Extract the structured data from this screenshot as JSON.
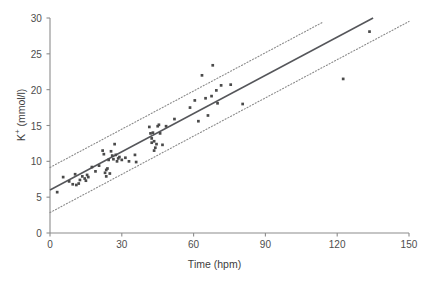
{
  "chart_data": {
    "type": "scatter",
    "title": "",
    "xlabel": "Time (hpm)",
    "ylabel_prefix": "K",
    "ylabel_sup": "+",
    "ylabel_suffix": " (mmol/l)",
    "ylabel": "K+ (mmol/l)",
    "xlim": [
      0,
      150
    ],
    "ylim": [
      0,
      30
    ],
    "xticks": [
      0,
      30,
      60,
      90,
      120,
      150
    ],
    "yticks": [
      0,
      5,
      10,
      15,
      20,
      25,
      30
    ],
    "xtick_labels": [
      "0",
      "30",
      "60",
      "90",
      "120",
      "150"
    ],
    "ytick_labels": [
      "0",
      "5",
      "10",
      "15",
      "20",
      "25",
      "30"
    ],
    "grid": false,
    "legend": "none",
    "marker_color": "#4a4a4a",
    "line_color": "#55565a",
    "band_color": "#8a8a8a",
    "axis_color": "#8c8c8c",
    "points": [
      [
        3.0,
        5.7
      ],
      [
        5.5,
        7.8
      ],
      [
        8.0,
        7.2
      ],
      [
        9.5,
        6.8
      ],
      [
        10.5,
        8.2
      ],
      [
        11.0,
        6.7
      ],
      [
        12.0,
        6.9
      ],
      [
        12.5,
        7.4
      ],
      [
        13.5,
        7.9
      ],
      [
        14.5,
        7.6
      ],
      [
        15.0,
        7.3
      ],
      [
        15.5,
        8.1
      ],
      [
        16.0,
        7.8
      ],
      [
        17.5,
        9.2
      ],
      [
        19.0,
        8.6
      ],
      [
        20.5,
        9.4
      ],
      [
        22.0,
        11.5
      ],
      [
        22.5,
        11.0
      ],
      [
        23.0,
        8.4
      ],
      [
        23.5,
        8.8
      ],
      [
        23.5,
        7.9
      ],
      [
        24.0,
        9.0
      ],
      [
        24.5,
        10.2
      ],
      [
        25.0,
        8.3
      ],
      [
        25.5,
        11.4
      ],
      [
        26.0,
        10.8
      ],
      [
        26.5,
        10.3
      ],
      [
        27.0,
        12.4
      ],
      [
        27.5,
        10.9
      ],
      [
        28.0,
        10.0
      ],
      [
        28.5,
        10.4
      ],
      [
        29.0,
        10.6
      ],
      [
        30.0,
        10.2
      ],
      [
        31.5,
        10.5
      ],
      [
        33.0,
        10.0
      ],
      [
        35.5,
        10.9
      ],
      [
        36.0,
        9.9
      ],
      [
        41.5,
        14.8
      ],
      [
        42.0,
        13.9
      ],
      [
        42.5,
        13.2
      ],
      [
        42.5,
        12.6
      ],
      [
        43.0,
        14.0
      ],
      [
        43.5,
        11.5
      ],
      [
        43.5,
        12.8
      ],
      [
        44.0,
        11.9
      ],
      [
        44.5,
        12.4
      ],
      [
        45.0,
        14.9
      ],
      [
        45.5,
        15.1
      ],
      [
        46.0,
        13.9
      ],
      [
        47.0,
        12.3
      ],
      [
        48.5,
        14.9
      ],
      [
        52.0,
        15.9
      ],
      [
        58.5,
        17.5
      ],
      [
        60.5,
        18.5
      ],
      [
        62.0,
        15.6
      ],
      [
        63.5,
        22.0
      ],
      [
        65.0,
        18.8
      ],
      [
        66.0,
        16.4
      ],
      [
        67.5,
        19.1
      ],
      [
        68.0,
        23.4
      ],
      [
        69.5,
        19.9
      ],
      [
        70.0,
        18.1
      ],
      [
        71.5,
        20.6
      ],
      [
        75.5,
        20.7
      ],
      [
        80.5,
        18.0
      ],
      [
        122.5,
        21.5
      ],
      [
        133.5,
        28.1
      ]
    ],
    "fit_line": {
      "style": "solid",
      "intercept": 6.0,
      "slope": 0.1778,
      "x_start": 0,
      "x_end": 135
    },
    "bands": [
      {
        "name": "upper-prediction-band",
        "style": "dotted",
        "intercept": 9.15,
        "slope": 0.1778,
        "x_start": 0,
        "x_end": 114
      },
      {
        "name": "lower-prediction-band",
        "style": "dotted",
        "intercept": 2.85,
        "slope": 0.1778,
        "x_start": 0,
        "x_end": 150
      }
    ]
  }
}
